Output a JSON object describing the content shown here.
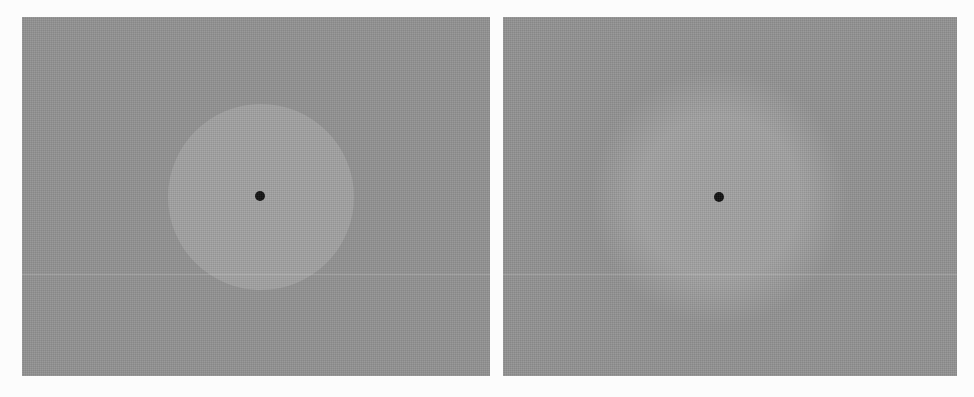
{
  "figure": {
    "panels": [
      {
        "id": "left",
        "label": "sharp-edged disc stimulus",
        "background_color": "#929292",
        "disc_color": "#a1a1a1",
        "disc_center": [
          239,
          180
        ],
        "disc_radius": 93,
        "disc_edge": "sharp",
        "fixation_dot_center": [
          238,
          179
        ],
        "fixation_dot_radius": 5,
        "fixation_dot_color": "#111111",
        "scanline_y": 257
      },
      {
        "id": "right",
        "label": "blurred-edge disc stimulus",
        "background_color": "#929292",
        "disc_color": "#a1a1a1",
        "disc_center": [
          216,
          180
        ],
        "disc_radius": 105,
        "disc_edge": "blurred",
        "fixation_dot_center": [
          216,
          180
        ],
        "fixation_dot_radius": 5,
        "fixation_dot_color": "#111111",
        "scanline_y": 257
      }
    ]
  }
}
